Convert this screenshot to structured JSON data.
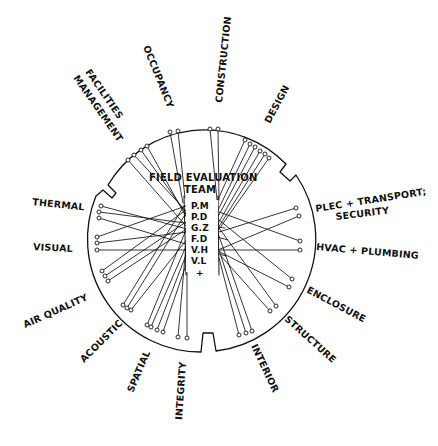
{
  "diagram": {
    "title": "FIELD EVALUATION",
    "subtitle": "TEAM",
    "team_members": [
      "P.M",
      "P.D",
      "G.Z",
      "F.D",
      "V.H",
      "V.L",
      "+"
    ],
    "outer_labels": {
      "facilities_line1": "FACILITIES",
      "facilities_line2": "MANAGEMENT",
      "occupancy": "OCCUPANCY",
      "construction": "CONSTRUCTION",
      "design": "DESIGN",
      "plec_line1": "PLEC + TRANSPORT;",
      "plec_line2": "SECURITY",
      "hvac": "HVAC + PLUMBING",
      "enclosure": "ENCLOSURE",
      "structure": "STRUCTURE",
      "interior": "INTERIOR",
      "integrity": "INTEGRITY",
      "spatial": "SPATIAL",
      "acoustic": "ACOUSTIC",
      "air_quality": "AIR QUALITY",
      "visual": "VISUAL",
      "thermal": "THERMAL"
    },
    "colors": {
      "ink": "#111111",
      "paper": "#ffffff"
    }
  }
}
